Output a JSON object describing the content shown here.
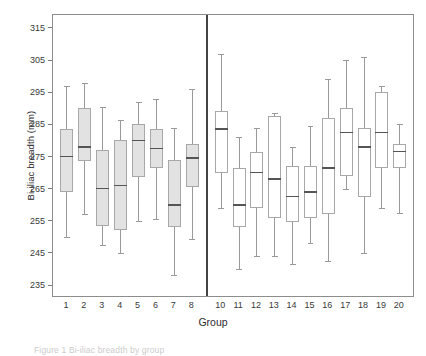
{
  "chart_data": {
    "type": "box",
    "title": "",
    "xlabel": "Group",
    "ylabel": "Bi-iliac breadth (mm)",
    "ylim": [
      231,
      319
    ],
    "yticks": [
      235,
      245,
      255,
      265,
      275,
      285,
      295,
      305,
      315
    ],
    "grid": false,
    "legend": "none",
    "panel_divider_after_category": "8",
    "categories": [
      "1",
      "2",
      "3",
      "4",
      "5",
      "6",
      "7",
      "8",
      "10",
      "11",
      "12",
      "13",
      "14",
      "15",
      "16",
      "17",
      "18",
      "19",
      "20"
    ],
    "box_style_by_panel": {
      "left_panel": "filled-grey",
      "right_panel": "open-white"
    },
    "boxes": [
      {
        "group": "1",
        "whisker_low": 250.0,
        "q1": 264.0,
        "median": 275.0,
        "q3": 283.5,
        "whisker_high": 297.0,
        "fill": "#e2e2e2"
      },
      {
        "group": "2",
        "whisker_low": 257.0,
        "q1": 273.5,
        "median": 278.0,
        "q3": 290.0,
        "whisker_high": 298.0,
        "fill": "#e2e2e2"
      },
      {
        "group": "3",
        "whisker_low": 247.5,
        "q1": 253.5,
        "median": 265.0,
        "q3": 277.0,
        "whisker_high": 290.5,
        "fill": "#e2e2e2"
      },
      {
        "group": "4",
        "whisker_low": 245.0,
        "q1": 252.0,
        "median": 266.0,
        "q3": 280.0,
        "whisker_high": 286.5,
        "fill": "#e2e2e2"
      },
      {
        "group": "5",
        "whisker_low": 255.0,
        "q1": 268.5,
        "median": 280.0,
        "q3": 285.0,
        "whisker_high": 292.0,
        "fill": "#e2e2e2"
      },
      {
        "group": "6",
        "whisker_low": 255.5,
        "q1": 271.5,
        "median": 277.5,
        "q3": 283.5,
        "whisker_high": 293.0,
        "fill": "#e2e2e2"
      },
      {
        "group": "7",
        "whisker_low": 238.0,
        "q1": 253.0,
        "median": 260.0,
        "q3": 274.0,
        "whisker_high": 284.0,
        "fill": "#e2e2e2"
      },
      {
        "group": "8",
        "whisker_low": 249.5,
        "q1": 265.5,
        "median": 274.5,
        "q3": 279.0,
        "whisker_high": 296.0,
        "fill": "#e2e2e2"
      },
      {
        "group": "10",
        "whisker_low": 259.0,
        "q1": 270.0,
        "median": 283.5,
        "q3": 289.0,
        "whisker_high": 307.0,
        "fill": "#ffffff"
      },
      {
        "group": "11",
        "whisker_low": 240.0,
        "q1": 253.0,
        "median": 260.0,
        "q3": 271.5,
        "whisker_high": 281.0,
        "fill": "#ffffff"
      },
      {
        "group": "12",
        "whisker_low": 244.0,
        "q1": 259.0,
        "median": 270.0,
        "q3": 276.5,
        "whisker_high": 284.0,
        "fill": "#ffffff"
      },
      {
        "group": "13",
        "whisker_low": 244.0,
        "q1": 256.0,
        "median": 268.0,
        "q3": 287.5,
        "whisker_high": 288.5,
        "fill": "#ffffff"
      },
      {
        "group": "14",
        "whisker_low": 241.5,
        "q1": 254.5,
        "median": 262.5,
        "q3": 272.0,
        "whisker_high": 278.0,
        "fill": "#ffffff"
      },
      {
        "group": "15",
        "whisker_low": 248.0,
        "q1": 256.0,
        "median": 264.0,
        "q3": 272.0,
        "whisker_high": 284.5,
        "fill": "#ffffff"
      },
      {
        "group": "16",
        "whisker_low": 242.5,
        "q1": 257.0,
        "median": 271.5,
        "q3": 287.0,
        "whisker_high": 299.0,
        "fill": "#ffffff"
      },
      {
        "group": "17",
        "whisker_low": 265.0,
        "q1": 269.0,
        "median": 282.5,
        "q3": 290.0,
        "whisker_high": 305.0,
        "fill": "#ffffff"
      },
      {
        "group": "18",
        "whisker_low": 245.0,
        "q1": 262.5,
        "median": 278.0,
        "q3": 284.0,
        "whisker_high": 306.0,
        "fill": "#ffffff"
      },
      {
        "group": "19",
        "whisker_low": 259.0,
        "q1": 271.5,
        "median": 282.5,
        "q3": 295.0,
        "whisker_high": 297.0,
        "fill": "#ffffff"
      },
      {
        "group": "20",
        "whisker_low": 257.5,
        "q1": 271.5,
        "median": 276.5,
        "q3": 279.0,
        "whisker_high": 285.0,
        "fill": "#ffffff"
      }
    ]
  },
  "caption": {
    "text": "Figure 1 Bi-iliac breadth by group"
  }
}
